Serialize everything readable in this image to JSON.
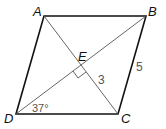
{
  "diagram": {
    "type": "rhombus-geometry",
    "vertices": {
      "A": {
        "label": "A",
        "x": 44,
        "y": 16
      },
      "B": {
        "label": "B",
        "x": 146,
        "y": 16
      },
      "C": {
        "label": "C",
        "x": 118,
        "y": 114
      },
      "D": {
        "label": "D",
        "x": 16,
        "y": 114
      },
      "E": {
        "label": "E",
        "x": 81,
        "y": 65
      }
    },
    "measurements": {
      "ce_length": "3",
      "bc_length": "5",
      "angle_d": "37°"
    },
    "colors": {
      "edge": "#111111",
      "diagonal": "#555555",
      "measure_text": "#555555",
      "vertex_text": "#111111"
    }
  }
}
